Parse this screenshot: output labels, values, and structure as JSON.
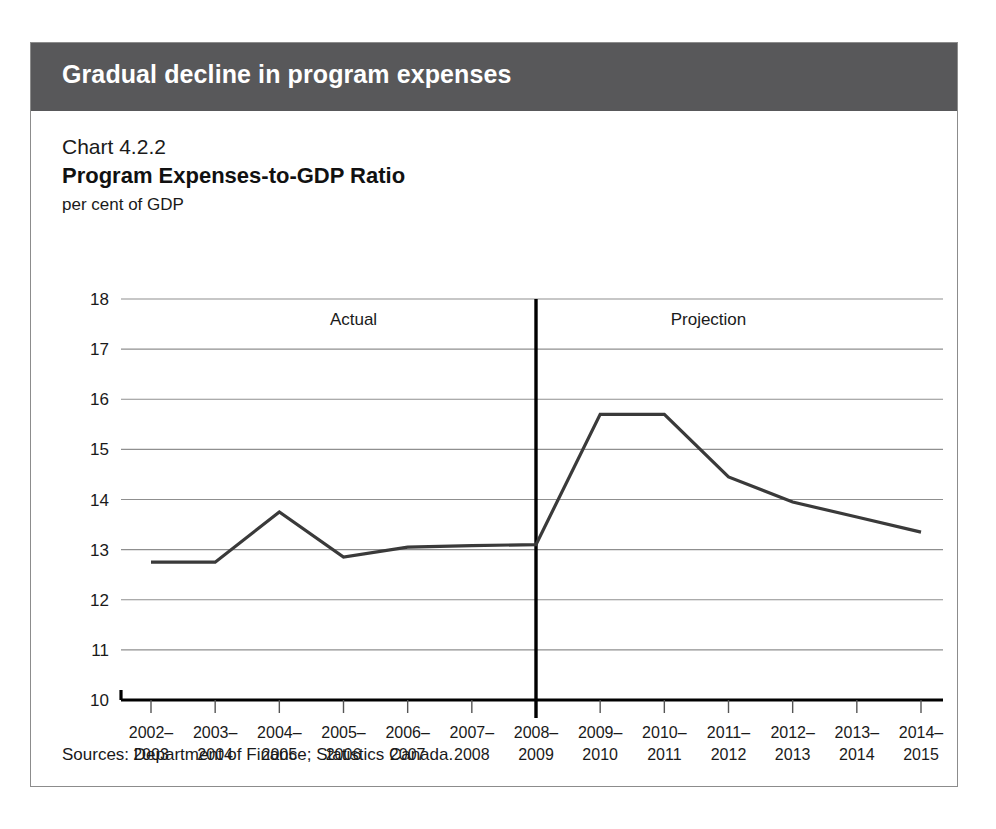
{
  "banner": {
    "title": "Gradual decline in program expenses"
  },
  "header": {
    "chart_number": "Chart 4.2.2",
    "chart_title": "Program Expenses-to-GDP Ratio",
    "axis_unit": "per cent of GDP"
  },
  "footer": {
    "sources": "Sources: Department of Finance; Statistics Canada."
  },
  "colors": {
    "banner_background": "#58585a",
    "banner_text": "#ffffff",
    "card_border": "#8c8c8c",
    "gridline": "#8f8f8f",
    "axis": "#000000",
    "series_line": "#3a3a3a",
    "divider": "#000000",
    "text": "#1a1a1a"
  },
  "chart_data": {
    "type": "line",
    "title": "Program Expenses-to-GDP Ratio",
    "subtitle": "Chart 4.2.2",
    "xlabel": "",
    "ylabel": "per cent of GDP",
    "ylim": [
      10,
      18
    ],
    "yticks": [
      10,
      11,
      12,
      13,
      14,
      15,
      16,
      17,
      18
    ],
    "ytick_labels": [
      "10",
      "11",
      "12",
      "13",
      "14",
      "15",
      "16",
      "17",
      "18"
    ],
    "grid": true,
    "legend": false,
    "categories": [
      "2002-\n2003",
      "2003-\n2004",
      "2004-\n2005",
      "2005-\n2006",
      "2006-\n2007",
      "2007-\n2008",
      "2008-\n2009",
      "2009-\n2010",
      "2010-\n2011",
      "2011-\n2012",
      "2012-\n2013",
      "2013-\n2014",
      "2014-\n2015"
    ],
    "categories_line1": [
      "2002–",
      "2003–",
      "2004–",
      "2005–",
      "2006–",
      "2007–",
      "2008–",
      "2009–",
      "2010–",
      "2011–",
      "2012–",
      "2013–",
      "2014–"
    ],
    "categories_line2": [
      "2003",
      "2004",
      "2005",
      "2006",
      "2007",
      "2008",
      "2009",
      "2010",
      "2011",
      "2012",
      "2013",
      "2014",
      "2015"
    ],
    "values": [
      12.75,
      12.75,
      13.75,
      12.85,
      13.05,
      13.08,
      13.1,
      15.7,
      15.7,
      14.45,
      13.95,
      13.65,
      13.35
    ],
    "annotations": [
      {
        "text": "Actual",
        "category_span": [
          "2002-2003",
          "2008-2009"
        ]
      },
      {
        "text": "Projection",
        "category_span": [
          "2008-2009",
          "2014-2015"
        ]
      }
    ],
    "divider": {
      "at_category": "2008-2009",
      "label_left": "Actual",
      "label_right": "Projection"
    }
  }
}
